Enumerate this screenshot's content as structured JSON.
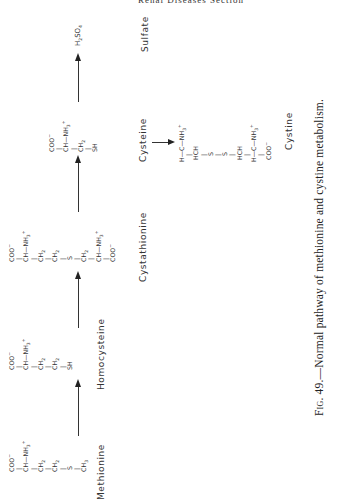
{
  "page": {
    "running_header": "Renal Diseases Section",
    "orientation": "rotated-90-ccw"
  },
  "compounds": {
    "methionine": {
      "name": "Methionine",
      "structure": [
        "COO⁻",
        "|",
        "CH—NH₃⁺",
        "|",
        "CH₂",
        "|",
        "CH₂",
        "|",
        "S",
        "|",
        "CH₃"
      ]
    },
    "homocysteine": {
      "name": "Homocysteine",
      "structure": [
        "COO⁻",
        "|",
        "CH—NH₃⁺",
        "|",
        "CH₂",
        "|",
        "CH₂",
        "|",
        "SH"
      ]
    },
    "cystathionine": {
      "name": "Cystathionine",
      "structure": [
        "COO⁻",
        "|",
        "CH—NH₃⁺",
        "|",
        "CH₂",
        "|",
        "CH₂",
        "|",
        "S",
        "|",
        "CH₂",
        "|",
        "CH—NH₃⁺",
        "|",
        "COO⁻"
      ]
    },
    "cysteine": {
      "name": "Cysteine",
      "structure": [
        "COO⁻",
        "|",
        "CH—NH₃⁺",
        "|",
        "CH₂",
        "|",
        "SH"
      ]
    },
    "cystine": {
      "name": "Cystine",
      "structure": [
        "H—C—NH₃⁺",
        "|",
        "HCH",
        "|",
        "S",
        "|",
        "S",
        "|",
        "HCH",
        "|",
        "H—C—NH₃⁺",
        "|",
        "COO⁻"
      ]
    },
    "sulfate": {
      "name": "Sulfate",
      "formula": "H₂SO₄"
    }
  },
  "pathway": [
    {
      "from": "Methionine",
      "to": "Homocysteine"
    },
    {
      "from": "Homocysteine",
      "to": "Cystathionine"
    },
    {
      "from": "Cystathionine",
      "to": "Cysteine"
    },
    {
      "from": "Cysteine",
      "to": "Sulfate"
    },
    {
      "from": "Cysteine",
      "to": "Cystine"
    }
  ],
  "caption": {
    "fig_label": "Fig. 49.",
    "text": "—Normal pathway of methionine and cystine metabolism."
  }
}
